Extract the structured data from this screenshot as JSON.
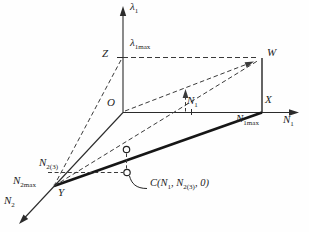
{
  "figure": {
    "type": "3d-axes-optimization-diagram",
    "colors": {
      "line": "#2b2b2b",
      "thick_line": "#161616",
      "background": "#fefefe"
    },
    "labels": {
      "lambda1_axis": {
        "base": "λ",
        "sub": "1"
      },
      "lambda1max": {
        "base": "λ",
        "sub": "1max"
      },
      "z": "Z",
      "w": "W",
      "o": "O",
      "x": "X",
      "y": "Y",
      "n1_axis": {
        "base": "N",
        "sub": "1"
      },
      "n1_point": {
        "base": "N",
        "sub": "1"
      },
      "n1max": {
        "base": "N",
        "sub": "1max"
      },
      "n2_axis": {
        "base": "N",
        "sub": "2"
      },
      "n2max": {
        "base": "N",
        "sub": "2max"
      },
      "n2_3": {
        "base": "N",
        "sub": "2(3)"
      },
      "c_point": {
        "p1": "C(N",
        "s1": "1",
        "p2": ", N",
        "s2": "2(3)",
        "p3": ", 0)"
      }
    }
  }
}
